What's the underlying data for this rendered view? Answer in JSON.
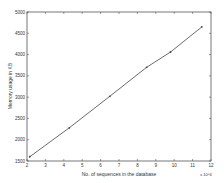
{
  "chart_data": {
    "type": "line",
    "title": "",
    "xlabel": "No. of sequences in the database",
    "ylabel": "Memory usage in KB",
    "x_multiplier": "x 10^4",
    "xlim": [
      2,
      12
    ],
    "ylim": [
      1500,
      5000
    ],
    "xticks": [
      2,
      3,
      4,
      5,
      6,
      7,
      8,
      9,
      10,
      11,
      12
    ],
    "yticks": [
      1500,
      2000,
      2500,
      3000,
      3500,
      4000,
      4500,
      5000
    ],
    "grid": false,
    "legend": null,
    "series": [
      {
        "name": "Memory usage",
        "x": [
          2.15,
          4.3,
          6.5,
          8.5,
          9.8,
          11.5
        ],
        "values": [
          1600,
          2280,
          3020,
          3700,
          4060,
          4650
        ],
        "marker": "dot",
        "color": "#444444"
      }
    ]
  }
}
